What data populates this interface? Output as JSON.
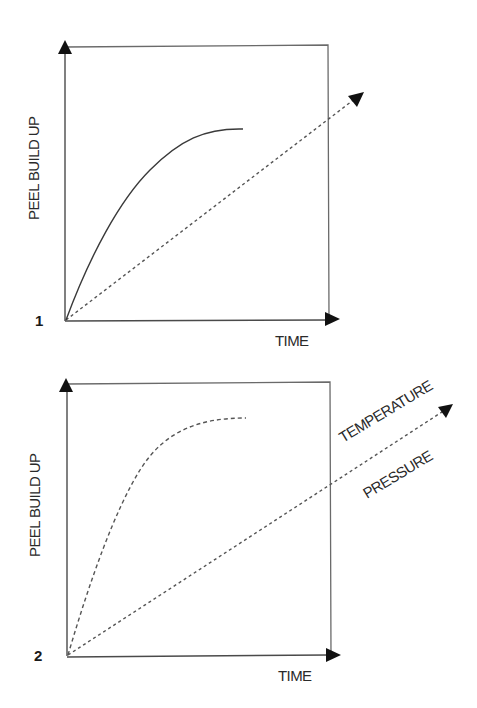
{
  "panels": [
    {
      "id": "1",
      "number_label": "1",
      "y_axis_label": "PEEL BUILD UP",
      "x_axis_label": "TIME",
      "curve_style": "solid",
      "diagonal_labels": []
    },
    {
      "id": "2",
      "number_label": "2",
      "y_axis_label": "PEEL BUILD UP",
      "x_axis_label": "TIME",
      "curve_style": "dashed",
      "diagonal_labels": [
        "TEMPERATURE",
        "PRESSURE"
      ]
    }
  ],
  "colors": {
    "ink": "#2a2a2a",
    "box": "#6a6a6a",
    "arrow": "#111111"
  }
}
